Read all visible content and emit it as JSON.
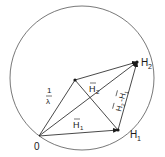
{
  "diagram": {
    "labels": {
      "origin": "0",
      "h1_point": "H",
      "h1_sub": "1",
      "h2_point": "H",
      "h2_sub": "2",
      "vec_h1": "H",
      "vec_h1_sub": "1",
      "vec_h2": "H",
      "vec_h2_sub": "2",
      "radius_num": "1",
      "radius_den": "λ",
      "diff_a": "H",
      "diff_a_sub": "2",
      "diff_sep": "-",
      "diff_b": "H",
      "diff_b_sub": "1"
    },
    "colors": {
      "stroke": "#1a1a1a",
      "circle": "#444444"
    }
  }
}
